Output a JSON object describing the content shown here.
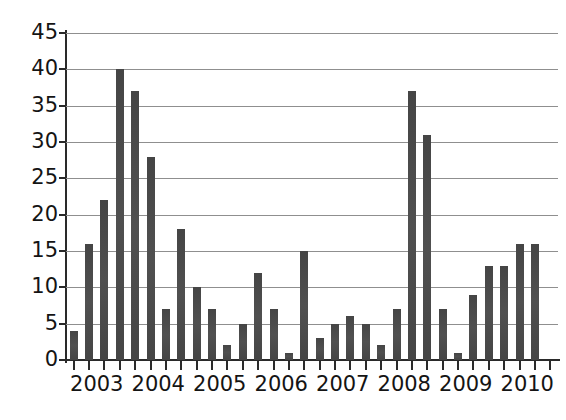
{
  "chart_data": {
    "type": "bar",
    "title": "",
    "subtitle": "",
    "xlabel": "",
    "ylabel": "",
    "ylim": [
      0,
      45
    ],
    "ytick_step": 5,
    "yticks": [
      0,
      5,
      10,
      15,
      20,
      25,
      30,
      35,
      40,
      45
    ],
    "grid": true,
    "legend": null,
    "legend_position": "none",
    "bar_color": "#4a4a4a",
    "axis_color": "#2a2a2a",
    "gridline_color": "#8f8f8f",
    "background": "#ffffff",
    "categories": [
      "2003 Q1",
      "2003 Q2",
      "2003 Q3",
      "2003 Q4",
      "2004 Q1",
      "2004 Q2",
      "2004 Q3",
      "2004 Q4",
      "2005 Q1",
      "2005 Q2",
      "2005 Q3",
      "2005 Q4",
      "2006 Q1",
      "2006 Q2",
      "2006 Q3",
      "2006 Q4",
      "2007 Q1",
      "2007 Q2",
      "2007 Q3",
      "2007 Q4",
      "2008 Q1",
      "2008 Q2",
      "2008 Q3",
      "2008 Q4",
      "2009 Q1",
      "2009 Q2",
      "2009 Q3",
      "2009 Q4",
      "2010 Q1",
      "2010 Q2",
      "2010 Q3",
      "2010 Q4"
    ],
    "values": [
      4,
      16,
      22,
      40,
      37,
      28,
      7,
      18,
      10,
      7,
      2,
      5,
      12,
      7,
      1,
      15,
      3,
      5,
      6,
      5,
      2,
      7,
      37,
      31,
      7,
      1,
      9,
      13,
      13,
      16,
      16,
      0
    ],
    "xtick_labels": [
      "2003",
      "2004",
      "2005",
      "2006",
      "2007",
      "2008",
      "2009",
      "2010"
    ]
  }
}
